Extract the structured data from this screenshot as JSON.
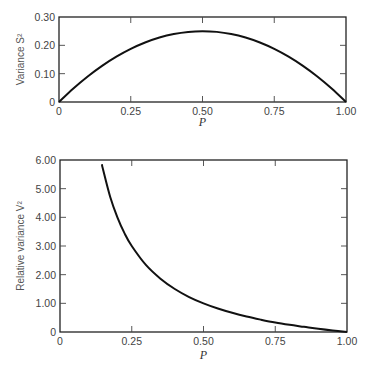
{
  "chart_data": [
    {
      "type": "line",
      "title": "",
      "xlabel": "P",
      "ylabel": "Variance S²",
      "xlim": [
        0,
        1.0
      ],
      "ylim": [
        0,
        0.3
      ],
      "xticks": [
        "0",
        "0.25",
        "0.50",
        "0.75",
        "1.00"
      ],
      "yticks": [
        "0",
        "0.10",
        "0.20",
        "0.30"
      ],
      "grid": false,
      "legend": null,
      "series": [
        {
          "name": "S² = P(1−P)",
          "x": [
            0,
            0.05,
            0.1,
            0.15,
            0.2,
            0.25,
            0.3,
            0.35,
            0.4,
            0.45,
            0.5,
            0.55,
            0.6,
            0.65,
            0.7,
            0.75,
            0.8,
            0.85,
            0.9,
            0.95,
            1.0
          ],
          "y": [
            0,
            0.0475,
            0.09,
            0.1275,
            0.16,
            0.1875,
            0.21,
            0.2275,
            0.24,
            0.2475,
            0.25,
            0.2475,
            0.24,
            0.2275,
            0.21,
            0.1875,
            0.16,
            0.1275,
            0.09,
            0.0475,
            0
          ]
        }
      ]
    },
    {
      "type": "line",
      "title": "",
      "xlabel": "P",
      "ylabel": "Relative variance V²",
      "xlim": [
        0,
        1.0
      ],
      "ylim": [
        0,
        6.0
      ],
      "xticks": [
        "0",
        "0.25",
        "0.50",
        "0.75",
        "1.00"
      ],
      "yticks": [
        "0",
        "1.00",
        "2.00",
        "3.00",
        "4.00",
        "5.00",
        "6.00"
      ],
      "grid": false,
      "legend": null,
      "series": [
        {
          "name": "V² = (1−P)/P",
          "x": [
            0.146,
            0.15,
            0.175,
            0.2,
            0.225,
            0.25,
            0.3,
            0.35,
            0.4,
            0.45,
            0.5,
            0.55,
            0.6,
            0.65,
            0.7,
            0.75,
            0.8,
            0.85,
            0.9,
            0.95,
            1.0
          ],
          "y": [
            5.85,
            5.67,
            4.71,
            4.0,
            3.44,
            3.0,
            2.33,
            1.86,
            1.5,
            1.22,
            1.0,
            0.82,
            0.67,
            0.54,
            0.43,
            0.33,
            0.25,
            0.18,
            0.11,
            0.05,
            0
          ]
        }
      ]
    }
  ]
}
